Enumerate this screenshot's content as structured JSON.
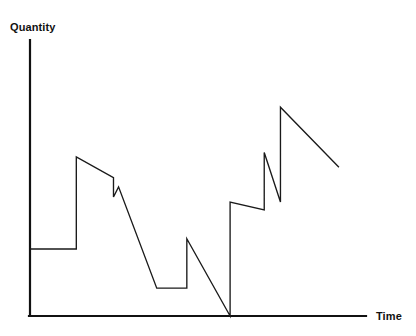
{
  "chart_data": {
    "type": "line",
    "title": "",
    "subtitle": "",
    "xlabel": "Time",
    "ylabel": "Quantity",
    "xlim": [
      0,
      100
    ],
    "ylim": [
      0,
      100
    ],
    "grid": false,
    "legend": null,
    "annotations": [],
    "xtick_labels": [],
    "ytick_labels": [],
    "series": [
      {
        "name": "Quantity over time",
        "color": "#1a1a1a",
        "points": [
          {
            "x": 0.0,
            "y": 27.9
          },
          {
            "x": 13.7,
            "y": 27.9
          },
          {
            "x": 13.7,
            "y": 66.3
          },
          {
            "x": 24.7,
            "y": 57.6
          },
          {
            "x": 24.7,
            "y": 49.6
          },
          {
            "x": 26.2,
            "y": 53.8
          },
          {
            "x": 37.5,
            "y": 11.6
          },
          {
            "x": 46.4,
            "y": 11.6
          },
          {
            "x": 46.4,
            "y": 32.2
          },
          {
            "x": 59.2,
            "y": 0.0
          },
          {
            "x": 59.2,
            "y": 47.5
          },
          {
            "x": 69.3,
            "y": 44.2
          },
          {
            "x": 69.3,
            "y": 68.1
          },
          {
            "x": 74.1,
            "y": 47.5
          },
          {
            "x": 74.1,
            "y": 87.0
          },
          {
            "x": 91.4,
            "y": 62.0
          }
        ]
      }
    ]
  },
  "axes": {
    "y_axis_name": "vertical-axis",
    "x_axis_name": "horizontal-axis",
    "y_label_text": "Quantity",
    "x_label_text": "Time"
  }
}
